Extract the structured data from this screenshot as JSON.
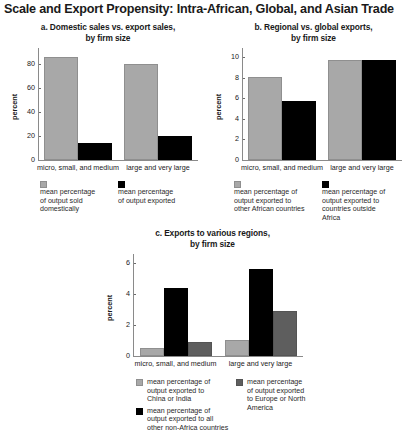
{
  "figure": {
    "title": "Scale and Export Propensity: Intra-African, Global, and Asian Trade"
  },
  "colors": {
    "light_gray": "#a8a8a8",
    "mid_gray": "#5e5e5e",
    "black": "#000000",
    "axis": "#8a8a8a"
  },
  "chart_data": [
    {
      "id": "a",
      "type": "bar",
      "title": "a.  Domestic sales vs. export sales,\nby firm size",
      "title_line1": "a.  Domestic sales vs. export sales,",
      "title_line2": "by firm size",
      "xlabel": "",
      "ylabel": "percent",
      "ylim": [
        0,
        90
      ],
      "yticks": [
        0,
        20,
        40,
        60,
        80
      ],
      "ytick_labels": [
        "0",
        "20",
        "40",
        "60",
        "80"
      ],
      "grid": false,
      "legend_position": "below",
      "categories": [
        "micro, small, and medium",
        "large and very large"
      ],
      "series": [
        {
          "name": "mean percentage of output sold domestically",
          "name_lines": [
            "mean percentage",
            "of output sold",
            "domestically"
          ],
          "color": "#a8a8a8",
          "values": [
            86,
            80
          ]
        },
        {
          "name": "mean percentage of output exported",
          "name_lines": [
            "mean percentage",
            "of output exported"
          ],
          "color": "#000000",
          "values": [
            14,
            20
          ]
        }
      ]
    },
    {
      "id": "b",
      "type": "bar",
      "title": "b. Regional vs. global exports,\nby firm size",
      "title_line1": "b. Regional vs. global exports,",
      "title_line2": "by firm size",
      "xlabel": "",
      "ylabel": "percent",
      "ylim": [
        0,
        10.5
      ],
      "yticks": [
        0,
        2,
        4,
        6,
        8,
        10
      ],
      "ytick_labels": [
        "0",
        "2",
        "4",
        "6",
        "8",
        "10"
      ],
      "grid": false,
      "legend_position": "below",
      "categories": [
        "micro, small, and medium",
        "large and very large"
      ],
      "series": [
        {
          "name": "mean percentage of output exported to other African countries",
          "name_lines": [
            "mean percentage of",
            "output exported to",
            "other African countries"
          ],
          "color": "#a8a8a8",
          "values": [
            8.1,
            9.7
          ]
        },
        {
          "name": "mean percentage of output exported to countries outside Africa",
          "name_lines": [
            "mean percentage of",
            "output exported to",
            "countries outside",
            "Africa"
          ],
          "color": "#000000",
          "values": [
            5.7,
            9.7
          ]
        }
      ]
    },
    {
      "id": "c",
      "type": "bar",
      "title": "c.  Exports to various regions,\nby firm size",
      "title_line1": "c.  Exports to various regions,",
      "title_line2": "by firm size",
      "xlabel": "",
      "ylabel": "percent",
      "ylim": [
        0,
        6.3
      ],
      "yticks": [
        0,
        2,
        4,
        6
      ],
      "ytick_labels": [
        "0",
        "2",
        "4",
        "6"
      ],
      "grid": false,
      "legend_position": "below",
      "categories": [
        "micro, small, and medium",
        "large and very large"
      ],
      "series": [
        {
          "name": "mean percentage of output exported to China or India",
          "name_lines": [
            "mean percentage of",
            "output exported to",
            "China or India"
          ],
          "color": "#a8a8a8",
          "values": [
            0.5,
            1.0
          ]
        },
        {
          "name": "mean percentage of output exported to all other non-Africa countries",
          "name_lines": [
            "mean percentage of",
            "output exported to all",
            "other non-Africa countries"
          ],
          "color": "#000000",
          "values": [
            4.4,
            5.6
          ]
        },
        {
          "name": "mean percentage of output exported to Europe or North America",
          "name_lines": [
            "mean percentage",
            "of output exported",
            "to Europe or North",
            "America"
          ],
          "color": "#5e5e5e",
          "values": [
            0.9,
            2.9
          ]
        }
      ]
    }
  ]
}
